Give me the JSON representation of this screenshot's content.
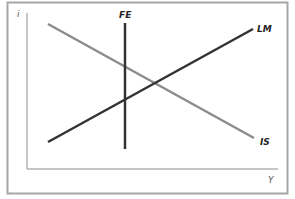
{
  "diagram": {
    "type": "IS-LM-FE",
    "axes": {
      "y_label": "i",
      "x_label": "Y"
    },
    "curves": [
      {
        "name": "IS",
        "label": "IS",
        "color": "#8c8c8c",
        "x1": 48,
        "y1": 24,
        "x2": 254,
        "y2": 138
      },
      {
        "name": "LM",
        "label": "LM",
        "color": "#333333",
        "x1": 48,
        "y1": 142,
        "x2": 253,
        "y2": 29
      },
      {
        "name": "FE",
        "label": "FE",
        "color": "#333333",
        "x1": 125,
        "y1": 23,
        "x2": 125,
        "y2": 149
      }
    ],
    "colors": {
      "frame": "#a6a6a6",
      "axis": "#8c8c8c"
    }
  }
}
